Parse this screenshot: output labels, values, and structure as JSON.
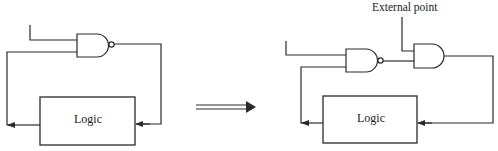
{
  "diagram": {
    "left": {
      "logic_box_label": "Logic",
      "gate_type": "NAND"
    },
    "transform_arrow": "double-line-arrow",
    "right": {
      "logic_box_label": "Logic",
      "external_point_label": "External point",
      "gate_types": [
        "NAND",
        "AND"
      ]
    }
  }
}
